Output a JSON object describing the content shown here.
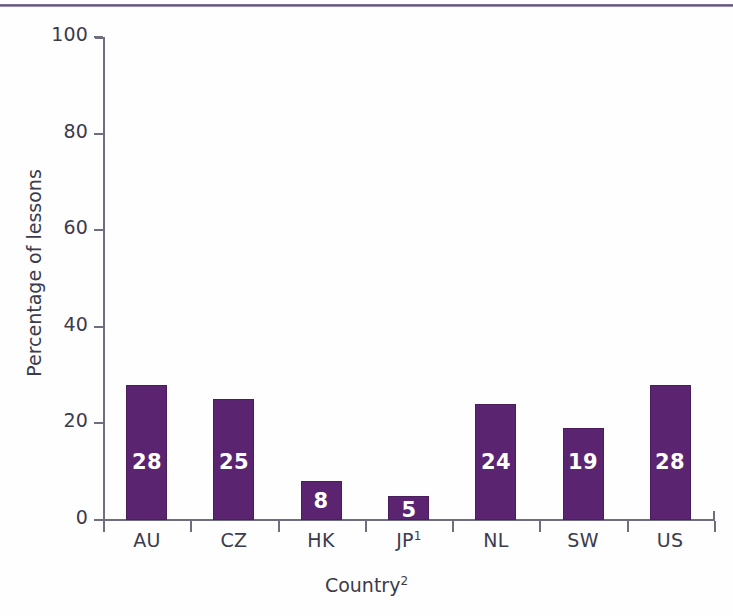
{
  "chart_data": {
    "type": "bar",
    "title": "",
    "subtitle": "",
    "xlabel": "Country",
    "xlabel_superscript": "2",
    "ylabel": "Percentage of lessons",
    "categories": [
      "AU",
      "CZ",
      "HK",
      "JP",
      "NL",
      "SW",
      "US"
    ],
    "category_superscripts": [
      "",
      "",
      "",
      "1",
      "",
      "",
      ""
    ],
    "values": [
      28,
      25,
      8,
      5,
      24,
      19,
      28
    ],
    "data_labels": [
      "28",
      "25",
      "8",
      "5",
      "24",
      "19",
      "28"
    ],
    "ylim": [
      0,
      100
    ],
    "yticks": [
      0,
      20,
      40,
      60,
      80,
      100
    ],
    "ytick_labels": [
      "0",
      "20",
      "40",
      "60",
      "80",
      "100"
    ],
    "grid": false,
    "legend": "none",
    "bar_color": "#5b2470",
    "bar_edge_color": "#4a1d5c",
    "axis_color": "#6e6e80",
    "text_color": "#3b3b4c",
    "label_text_color": "#ffffff",
    "rule_color": "#5f4d77"
  }
}
